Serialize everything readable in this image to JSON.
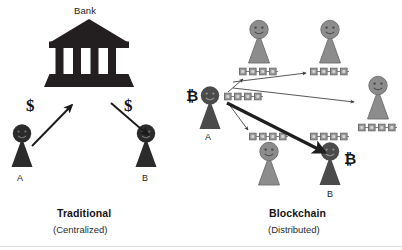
{
  "figure": {
    "type": "diagram",
    "subtype": "comparison-illustration",
    "background_color": "#ffffff",
    "panels": [
      {
        "id": "traditional",
        "caption_title": "Traditional",
        "caption_subtitle": "(Centralized)",
        "hub": {
          "label": "Bank",
          "icon": "bank-building-icon",
          "color": "#231f20"
        },
        "actors": [
          {
            "id": "a",
            "label": "A",
            "color": "#231f20",
            "role": "sender"
          },
          {
            "id": "b",
            "label": "B",
            "color": "#231f20",
            "role": "receiver"
          }
        ],
        "flows": [
          {
            "id": "a-to-bank",
            "label": "$",
            "from": "A",
            "to": "Bank"
          },
          {
            "id": "bank-to-b",
            "label": "$",
            "from": "Bank",
            "to": "B"
          }
        ]
      },
      {
        "id": "blockchain",
        "caption_title": "Blockchain",
        "caption_subtitle": "(Distributed)",
        "actors": [
          {
            "id": "a",
            "label": "A",
            "color": "#3c3c3c",
            "role": "sender",
            "currency": "₿"
          },
          {
            "id": "b",
            "label": "B",
            "color": "#4b4b4b",
            "role": "receiver",
            "currency": "₿"
          },
          {
            "id": "node-top-left",
            "label": "",
            "color": "#8c8c8c",
            "role": "peer-node"
          },
          {
            "id": "node-top-right",
            "label": "",
            "color": "#8c8c8c",
            "role": "peer-node"
          },
          {
            "id": "node-right",
            "label": "",
            "color": "#8c8c8c",
            "role": "peer-node"
          },
          {
            "id": "node-bottom-left",
            "label": "",
            "color": "#8c8c8c",
            "role": "peer-node"
          }
        ],
        "ledgers": [
          {
            "id": "ledger-a",
            "blocks": 4,
            "owner": "a"
          },
          {
            "id": "ledger-top-left",
            "blocks": 4,
            "owner": "node-top-left"
          },
          {
            "id": "ledger-top-right",
            "blocks": 4,
            "owner": "node-top-right"
          },
          {
            "id": "ledger-right",
            "blocks": 4,
            "owner": "node-right"
          },
          {
            "id": "ledger-bottom-left",
            "blocks": 4,
            "owner": "node-bottom-left"
          },
          {
            "id": "ledger-b",
            "blocks": 4,
            "owner": "b"
          }
        ],
        "broadcast_arrows": 4,
        "transfer_arrow": {
          "from": "a",
          "to": "b",
          "emphasis": "bold"
        }
      }
    ],
    "text": {
      "bank_label": "Bank",
      "dollar_sign": "$",
      "bitcoin_sign": "₿",
      "person_a": "A",
      "person_b": "B",
      "traditional_title": "Traditional",
      "traditional_sub": "(Centralized)",
      "blockchain_title": "Blockchain",
      "blockchain_sub": "(Distributed)"
    },
    "colors": {
      "ink": "#231f20",
      "dark_figure": "#2b2b2b",
      "mid_figure": "#4b4b4b",
      "gray_figure": "#8c8c8c",
      "gray_figure_stroke": "#6d6d6d",
      "block_fill": "#9a9a9a",
      "block_stroke": "#6f6f6f",
      "arrow": "#3a3a3a",
      "background": "#ffffff"
    }
  }
}
